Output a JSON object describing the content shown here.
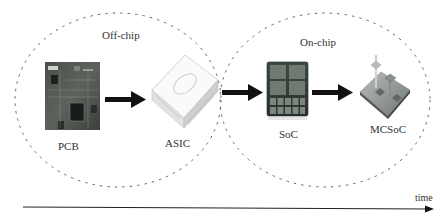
{
  "diagram": {
    "regions": [
      {
        "label": "Off-chip"
      },
      {
        "label": "On-chip"
      }
    ],
    "nodes": [
      {
        "label": "PCB",
        "icon": "pcb-board-icon"
      },
      {
        "label": "ASIC",
        "icon": "asic-chip-icon"
      },
      {
        "label": "SoC",
        "icon": "soc-die-icon"
      },
      {
        "label": "MCSoC",
        "icon": "mcsoc-3d-chip-icon"
      }
    ],
    "edges": [
      {
        "from": "PCB",
        "to": "ASIC"
      },
      {
        "from": "ASIC",
        "to": "SoC"
      },
      {
        "from": "SoC",
        "to": "MCSoC"
      }
    ],
    "axis": {
      "label": "time"
    }
  }
}
